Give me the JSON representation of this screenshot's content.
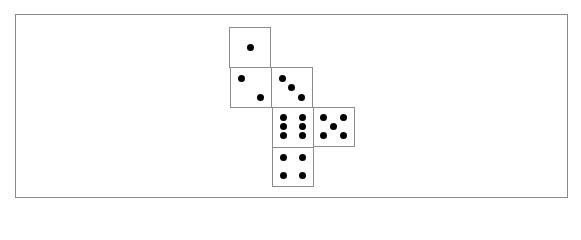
{
  "diagram": {
    "title": "",
    "colors": {
      "background": "#ffffff",
      "frame": "#8a8a8a",
      "face_border": "#8c8c8c",
      "pip": "#000000"
    },
    "frame": {
      "x": 15,
      "y": 14,
      "w": 553,
      "h": 184
    },
    "pip_diameter": 7,
    "faces": [
      {
        "name": "one",
        "value": 1,
        "x": 229,
        "y": 27,
        "w": 42,
        "h": 41,
        "pips": [
          [
            250,
            47
          ]
        ]
      },
      {
        "name": "two",
        "value": 2,
        "x": 230,
        "y": 67,
        "w": 42,
        "h": 41,
        "pips": [
          [
            241,
            78
          ],
          [
            260,
            97
          ]
        ]
      },
      {
        "name": "three",
        "value": 3,
        "x": 271,
        "y": 67,
        "w": 42,
        "h": 41,
        "pips": [
          [
            282,
            78
          ],
          [
            291,
            87
          ],
          [
            301,
            97
          ]
        ]
      },
      {
        "name": "six",
        "value": 6,
        "x": 272,
        "y": 107,
        "w": 42,
        "h": 41,
        "pips": [
          [
            283,
            117
          ],
          [
            302,
            117
          ],
          [
            283,
            126
          ],
          [
            302,
            126
          ],
          [
            283,
            135
          ],
          [
            302,
            135
          ]
        ]
      },
      {
        "name": "five",
        "value": 5,
        "x": 313,
        "y": 107,
        "w": 42,
        "h": 40,
        "pips": [
          [
            323,
            117
          ],
          [
            343,
            117
          ],
          [
            333,
            126
          ],
          [
            323,
            135
          ],
          [
            343,
            135
          ]
        ]
      },
      {
        "name": "four",
        "value": 4,
        "x": 272,
        "y": 147,
        "w": 42,
        "h": 40,
        "pips": [
          [
            283,
            157
          ],
          [
            302,
            157
          ],
          [
            283,
            175
          ],
          [
            302,
            175
          ]
        ]
      }
    ]
  }
}
